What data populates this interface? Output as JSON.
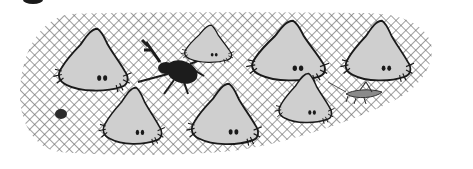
{
  "scene": {
    "description": "Black and white illustration of gray blob creatures with small eyes, a black beetle, and a grasshopper on a crosshatched ground patch",
    "colors": {
      "background": "#ffffff",
      "hatch": "#6a6a6a",
      "creature_fill": "#cfcfcf",
      "outline": "#1a1a1a",
      "beetle": "#1c1c1c",
      "grasshopper": "#8a8a8a"
    },
    "creatures": [
      {
        "id": "blob-1",
        "x": 55,
        "y": 28,
        "w": 72,
        "h": 62
      },
      {
        "id": "blob-2",
        "x": 180,
        "y": 25,
        "w": 50,
        "h": 38
      },
      {
        "id": "blob-3",
        "x": 100,
        "y": 87,
        "w": 62,
        "h": 58
      },
      {
        "id": "blob-4",
        "x": 186,
        "y": 83,
        "w": 72,
        "h": 62
      },
      {
        "id": "blob-5",
        "x": 245,
        "y": 20,
        "w": 82,
        "h": 62
      },
      {
        "id": "blob-6",
        "x": 275,
        "y": 73,
        "w": 58,
        "h": 50
      },
      {
        "id": "blob-7",
        "x": 340,
        "y": 20,
        "w": 70,
        "h": 62
      }
    ],
    "insects": [
      {
        "id": "beetle",
        "label": "rhinoceros beetle"
      },
      {
        "id": "grasshopper",
        "label": "grasshopper"
      },
      {
        "id": "pebble",
        "label": "small dark blob"
      }
    ]
  }
}
